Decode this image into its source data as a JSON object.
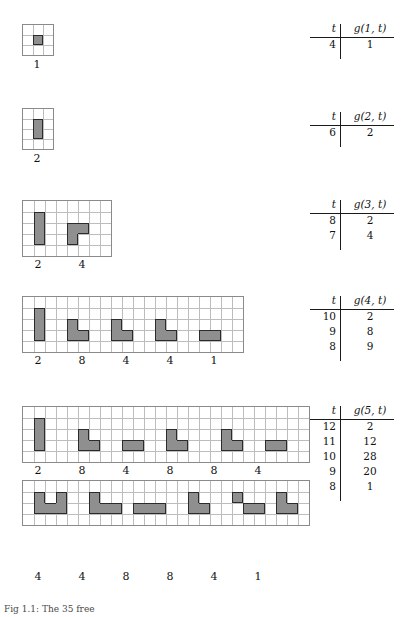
{
  "page": {
    "caption": "Fig 1.1: The 35 free"
  },
  "colors": {
    "cell_fill": "#8f8f8f",
    "cell_edge": "#2b2b2b",
    "grid_line": "#bdbdbd",
    "grid_border": "#8a8a8a",
    "rule": "#1a1a1a",
    "text": "#111111",
    "background": "#ffffff"
  },
  "figures": [
    {
      "id": "n1",
      "order": 1,
      "grid": {
        "cols": 3,
        "rows": 3,
        "cell": 10
      },
      "pieces": [
        {
          "label": "1",
          "cells": [
            [
              1,
              1
            ]
          ]
        }
      ]
    },
    {
      "id": "n2",
      "order": 2,
      "grid": {
        "cols": 3,
        "rows": 4,
        "cell": 10
      },
      "pieces": [
        {
          "label": "2",
          "cells": [
            [
              1,
              1
            ],
            [
              1,
              2
            ]
          ]
        }
      ]
    },
    {
      "id": "n3",
      "order": 3,
      "grid": {
        "cols": 8,
        "rows": 5,
        "cell": 11
      },
      "pieces": [
        {
          "label": "2",
          "cells": [
            [
              1,
              1
            ],
            [
              1,
              2
            ],
            [
              1,
              3
            ]
          ]
        },
        {
          "label": "4",
          "cells": [
            [
              4,
              2
            ],
            [
              5,
              2
            ],
            [
              4,
              3
            ]
          ]
        }
      ]
    },
    {
      "id": "n4",
      "order": 4,
      "grid": {
        "cols": 20,
        "rows": 5,
        "cell": 11
      },
      "pieces": [
        {
          "label": "2",
          "cells": [
            [
              1,
              1
            ],
            [
              1,
              2
            ],
            [
              1,
              3
            ]
          ]
        },
        {
          "label": "8",
          "cells": [
            [
              4,
              2
            ],
            [
              4,
              3
            ],
            [
              5,
              3
            ]
          ]
        },
        {
          "label": "4",
          "cells": [
            [
              8,
              2
            ],
            [
              9,
              3
            ],
            [
              8,
              3
            ]
          ]
        },
        {
          "label": "4",
          "cells": [
            [
              12,
              2
            ],
            [
              12,
              3
            ],
            [
              13,
              3
            ]
          ]
        },
        {
          "label": "1",
          "cells": [
            [
              16,
              3
            ],
            [
              17,
              3
            ]
          ]
        }
      ]
    },
    {
      "id": "n5a",
      "order": 5,
      "grid": {
        "cols": 26,
        "rows": 5,
        "cell": 11
      },
      "pieces": [
        {
          "label": "2",
          "cells": [
            [
              1,
              1
            ],
            [
              1,
              2
            ],
            [
              1,
              3
            ]
          ]
        },
        {
          "label": "8",
          "cells": [
            [
              5,
              2
            ],
            [
              5,
              3
            ],
            [
              6,
              3
            ]
          ]
        },
        {
          "label": "4",
          "cells": [
            [
              9,
              3
            ],
            [
              10,
              3
            ]
          ]
        },
        {
          "label": "8",
          "cells": [
            [
              13,
              2
            ],
            [
              13,
              3
            ],
            [
              14,
              3
            ]
          ]
        },
        {
          "label": "8",
          "cells": [
            [
              18,
              2
            ],
            [
              18,
              3
            ],
            [
              19,
              3
            ]
          ]
        },
        {
          "label": "4",
          "cells": [
            [
              22,
              3
            ],
            [
              23,
              3
            ]
          ]
        }
      ]
    },
    {
      "id": "n5b",
      "order": 5,
      "grid": {
        "cols": 26,
        "rows": 4,
        "cell": 11
      },
      "pieces": [
        {
          "label": "4",
          "cells": [
            [
              1,
              1
            ],
            [
              1,
              2
            ],
            [
              2,
              2
            ],
            [
              3,
              1
            ],
            [
              3,
              2
            ]
          ]
        },
        {
          "label": "4",
          "cells": [
            [
              6,
              1
            ],
            [
              6,
              2
            ],
            [
              7,
              2
            ],
            [
              8,
              2
            ]
          ]
        },
        {
          "label": "8",
          "cells": [
            [
              10,
              2
            ],
            [
              11,
              2
            ],
            [
              12,
              2
            ]
          ]
        },
        {
          "label": "8",
          "cells": [
            [
              15,
              1
            ],
            [
              15,
              2
            ],
            [
              16,
              2
            ]
          ]
        },
        {
          "label": "4",
          "cells": [
            [
              19,
              1
            ],
            [
              20,
              2
            ],
            [
              21,
              2
            ]
          ]
        },
        {
          "label": "1",
          "cells": [
            [
              23,
              1
            ],
            [
              23,
              2
            ],
            [
              24,
              2
            ]
          ]
        }
      ]
    }
  ],
  "tables": [
    {
      "id": "g1",
      "header": {
        "t": "t",
        "g": "g(1, t)"
      },
      "rows": [
        {
          "t": "4",
          "g": "1"
        }
      ]
    },
    {
      "id": "g2",
      "header": {
        "t": "t",
        "g": "g(2, t)"
      },
      "rows": [
        {
          "t": "6",
          "g": "2"
        }
      ]
    },
    {
      "id": "g3",
      "header": {
        "t": "t",
        "g": "g(3, t)"
      },
      "rows": [
        {
          "t": "8",
          "g": "2"
        },
        {
          "t": "7",
          "g": "4"
        }
      ]
    },
    {
      "id": "g4",
      "header": {
        "t": "t",
        "g": "g(4, t)"
      },
      "rows": [
        {
          "t": "10",
          "g": "2"
        },
        {
          "t": "9",
          "g": "8"
        },
        {
          "t": "8",
          "g": "9"
        }
      ]
    },
    {
      "id": "g5",
      "header": {
        "t": "t",
        "g": "g(5, t)"
      },
      "rows": [
        {
          "t": "12",
          "g": "2"
        },
        {
          "t": "11",
          "g": "12"
        },
        {
          "t": "10",
          "g": "28"
        },
        {
          "t": "9",
          "g": "20"
        },
        {
          "t": "8",
          "g": "1"
        }
      ]
    }
  ],
  "chart_data": {
    "type": "table",
    "series": [
      {
        "name": "g(1,t)",
        "t": [
          4
        ],
        "g": [
          1
        ]
      },
      {
        "name": "g(2,t)",
        "t": [
          6
        ],
        "g": [
          2
        ]
      },
      {
        "name": "g(3,t)",
        "t": [
          8,
          7
        ],
        "g": [
          2,
          4
        ]
      },
      {
        "name": "g(4,t)",
        "t": [
          10,
          9,
          8
        ],
        "g": [
          2,
          8,
          9
        ]
      },
      {
        "name": "g(5,t)",
        "t": [
          12,
          11,
          10,
          9,
          8
        ],
        "g": [
          2,
          12,
          28,
          20,
          1
        ]
      }
    ]
  },
  "layout": {
    "figures": [
      {
        "id": "n1",
        "x": 22,
        "y": 24,
        "labelY": 58,
        "labelXs": [
          37
        ]
      },
      {
        "id": "n2",
        "x": 22,
        "y": 108,
        "labelY": 152,
        "labelXs": [
          37
        ]
      },
      {
        "id": "n3",
        "x": 22,
        "y": 200,
        "labelY": 258,
        "labelXs": [
          38,
          82
        ]
      },
      {
        "id": "n4",
        "x": 22,
        "y": 296,
        "labelY": 354,
        "labelXs": [
          38,
          82,
          126,
          170,
          214
        ]
      },
      {
        "id": "n5a",
        "x": 22,
        "y": 406,
        "labelY": 464,
        "labelXs": [
          38,
          82,
          126,
          170,
          214,
          258
        ]
      },
      {
        "id": "n5b",
        "x": 22,
        "y": 480,
        "labelY": 570,
        "labelXs": [
          38,
          82,
          126,
          170,
          214,
          258
        ]
      }
    ],
    "tables": [
      {
        "id": "g1",
        "x": 310,
        "y": 22
      },
      {
        "id": "g2",
        "x": 310,
        "y": 110
      },
      {
        "id": "g3",
        "x": 310,
        "y": 198
      },
      {
        "id": "g4",
        "x": 310,
        "y": 294
      },
      {
        "id": "g5",
        "x": 310,
        "y": 404
      }
    ],
    "caption": {
      "x": 4,
      "y": 604
    }
  }
}
